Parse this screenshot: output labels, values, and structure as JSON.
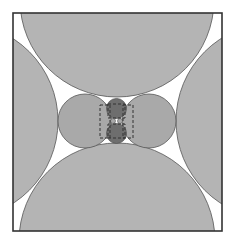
{
  "diagram": {
    "colors": {
      "background": "#ffffff",
      "frame_stroke": "#333333",
      "large_fill": "#b4b4b4",
      "medium_fill": "#a9a9a9",
      "small_fill": "#6e6e6e",
      "circle_stroke": "#555555",
      "dash_stroke": "#333333"
    },
    "frame": {
      "x": 13,
      "y": 13,
      "width": 209,
      "height": 218
    },
    "large_circles": [
      {
        "name": "top",
        "cx": 117,
        "cy": 0,
        "r": 97
      },
      {
        "name": "bottom",
        "cx": 117,
        "cy": 241,
        "r": 98
      },
      {
        "name": "left",
        "cx": -40,
        "cy": 121,
        "r": 98
      },
      {
        "name": "right",
        "cx": 274,
        "cy": 121,
        "r": 98
      }
    ],
    "medium_circles": [
      {
        "name": "left",
        "cx": 85,
        "cy": 121,
        "r": 27
      },
      {
        "name": "right",
        "cx": 149,
        "cy": 121,
        "r": 27
      }
    ],
    "small_circles": [
      {
        "name": "top",
        "cx": 116.5,
        "cy": 108.5,
        "r": 10
      },
      {
        "name": "bottom",
        "cx": 116.5,
        "cy": 133.5,
        "r": 10
      }
    ],
    "tiny_circles": [
      {
        "name": "left",
        "cx": 113,
        "cy": 121,
        "r": 2.5
      },
      {
        "name": "right",
        "cx": 120,
        "cy": 121,
        "r": 2.5
      }
    ],
    "dashed_rects": [
      {
        "name": "left",
        "x": 100,
        "y": 105,
        "width": 10,
        "height": 33
      },
      {
        "name": "right",
        "x": 123,
        "y": 105,
        "width": 10,
        "height": 33
      },
      {
        "name": "center-top",
        "x": 108,
        "y": 104,
        "width": 17,
        "height": 14
      },
      {
        "name": "center-bottom",
        "x": 108,
        "y": 124,
        "width": 17,
        "height": 14
      }
    ]
  }
}
